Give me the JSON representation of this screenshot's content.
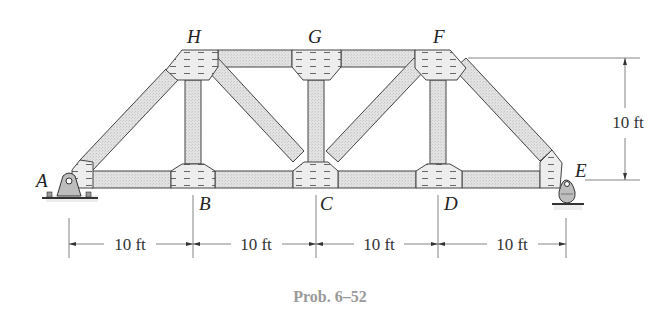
{
  "figure": {
    "type": "truss",
    "caption": "Prob. 6–52",
    "joints": {
      "A": "A",
      "B": "B",
      "C": "C",
      "D": "D",
      "E": "E",
      "F": "F",
      "G": "G",
      "H": "H"
    },
    "dimensions": {
      "panel_1": "10 ft",
      "panel_2": "10 ft",
      "panel_3": "10 ft",
      "panel_4": "10 ft",
      "height": "10 ft"
    },
    "supports": {
      "A": "pin",
      "E": "rocker"
    },
    "colors": {
      "member_fill": "#dcdcdc",
      "gusset_fill": "#eaeaea",
      "outline": "#444444",
      "caption": "#9a9a9a"
    }
  }
}
